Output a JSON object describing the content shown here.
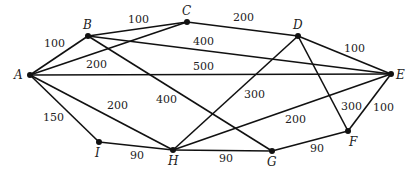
{
  "graph": {
    "nodes": [
      {
        "id": "A",
        "x": 30,
        "y": 75,
        "lx": 14,
        "ly": 79
      },
      {
        "id": "B",
        "x": 88,
        "y": 36,
        "lx": 83,
        "ly": 29
      },
      {
        "id": "C",
        "x": 187,
        "y": 22,
        "lx": 182,
        "ly": 15
      },
      {
        "id": "D",
        "x": 298,
        "y": 36,
        "lx": 293,
        "ly": 29
      },
      {
        "id": "E",
        "x": 391,
        "y": 74,
        "lx": 396,
        "ly": 79
      },
      {
        "id": "F",
        "x": 348,
        "y": 131,
        "lx": 349,
        "ly": 146
      },
      {
        "id": "G",
        "x": 272,
        "y": 151,
        "lx": 267,
        "ly": 166
      },
      {
        "id": "H",
        "x": 173,
        "y": 150,
        "lx": 168,
        "ly": 165
      },
      {
        "id": "I",
        "x": 99,
        "y": 142,
        "lx": 95,
        "ly": 157
      }
    ],
    "edges": [
      {
        "from": "A",
        "to": "B",
        "weight": "100",
        "lx": 44,
        "ly": 47
      },
      {
        "from": "B",
        "to": "C",
        "weight": "100",
        "lx": 128,
        "ly": 23
      },
      {
        "from": "C",
        "to": "D",
        "weight": "200",
        "lx": 233,
        "ly": 21
      },
      {
        "from": "D",
        "to": "E",
        "weight": "100",
        "lx": 344,
        "ly": 52
      },
      {
        "from": "A",
        "to": "C",
        "weight": "200",
        "lx": 86,
        "ly": 68
      },
      {
        "from": "B",
        "to": "E",
        "weight": "400",
        "lx": 193,
        "ly": 45
      },
      {
        "from": "A",
        "to": "E",
        "weight": "500",
        "lx": 193,
        "ly": 70
      },
      {
        "from": "B",
        "to": "G",
        "weight": "400",
        "lx": 156,
        "ly": 103
      },
      {
        "from": "A",
        "to": "H",
        "weight": "200",
        "lx": 107,
        "ly": 109
      },
      {
        "from": "A",
        "to": "I",
        "weight": "150",
        "lx": 43,
        "ly": 121
      },
      {
        "from": "I",
        "to": "H",
        "weight": "90",
        "lx": 130,
        "ly": 159
      },
      {
        "from": "H",
        "to": "G",
        "weight": "90",
        "lx": 219,
        "ly": 162
      },
      {
        "from": "G",
        "to": "F",
        "weight": "90",
        "lx": 310,
        "ly": 152
      },
      {
        "from": "F",
        "to": "E",
        "weight": "100",
        "lx": 373,
        "ly": 111
      },
      {
        "from": "D",
        "to": "H",
        "weight": "300",
        "lx": 244,
        "ly": 98
      },
      {
        "from": "D",
        "to": "F",
        "weight": "300",
        "lx": 341,
        "ly": 110
      },
      {
        "from": "H",
        "to": "E",
        "weight": "200",
        "lx": 285,
        "ly": 123
      }
    ]
  }
}
